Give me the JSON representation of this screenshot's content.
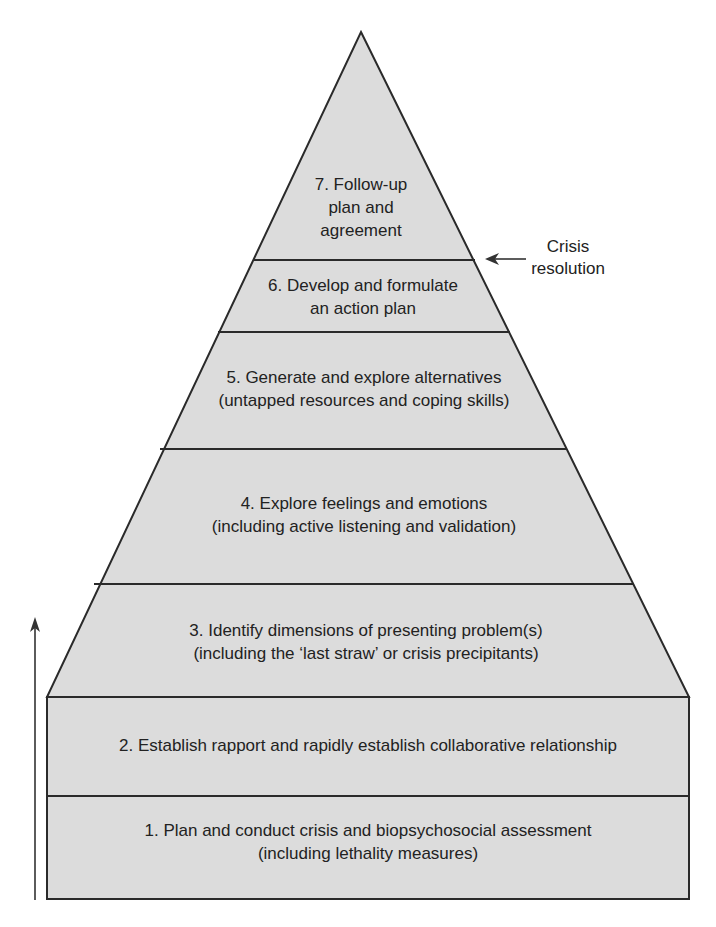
{
  "diagram": {
    "type": "pyramid",
    "fill_color": "#dcdcdc",
    "stroke_color": "#2a2a2a",
    "levels": [
      {
        "step": 7,
        "lines": [
          "7. Follow-up",
          "plan and",
          "agreement"
        ]
      },
      {
        "step": 6,
        "lines": [
          "6. Develop and formulate",
          "an action plan"
        ]
      },
      {
        "step": 5,
        "lines": [
          "5. Generate and explore alternatives",
          "(untapped resources and coping skills)"
        ]
      },
      {
        "step": 4,
        "lines": [
          "4. Explore feelings and emotions",
          "(including active listening and validation)"
        ]
      },
      {
        "step": 3,
        "lines": [
          "3. Identify dimensions of presenting problem(s)",
          "(including the ‘last straw’ or crisis precipitants)"
        ]
      },
      {
        "step": 2,
        "lines": [
          "2. Establish rapport and rapidly establish collaborative relationship"
        ]
      },
      {
        "step": 1,
        "lines": [
          "1. Plan and conduct crisis and biopsychosocial assessment",
          "(including lethality measures)"
        ]
      }
    ],
    "annotation": {
      "lines": [
        "Crisis",
        "resolution"
      ],
      "points_to": "boundary between step 7 and step 6"
    },
    "progress_arrow": {
      "direction": "up",
      "meaning": "progression from step 1 to step 7"
    }
  }
}
